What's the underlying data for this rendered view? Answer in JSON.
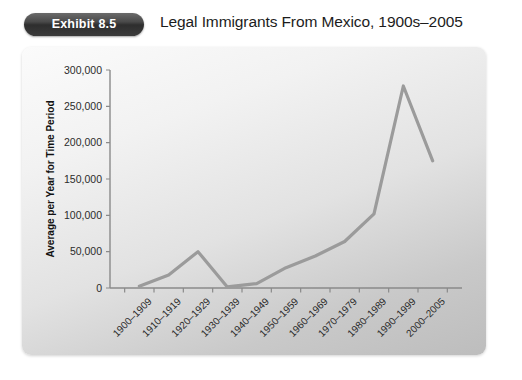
{
  "header": {
    "badge_label": "Exhibit 8.5",
    "title": "Legal Immigrants From Mexico, 1900s–2005"
  },
  "colors": {
    "badge_background": "#3b3b3b",
    "badge_text": "#ffffff",
    "line": "#9b9b9b",
    "axis": "#8a8a8a",
    "panel_light": "#fbfbfb",
    "panel_dark": "#bdbdbd",
    "text": "#1c1c1c"
  },
  "chart_data": {
    "type": "line",
    "title": "Legal Immigrants From Mexico, 1900s–2005",
    "xlabel": "",
    "ylabel": "Average per Year for Time Period",
    "categories": [
      "1900–1909",
      "1910–1919",
      "1920–1929",
      "1930–1939",
      "1940–1949",
      "1950–1959",
      "1960–1969",
      "1970–1979",
      "1980–1989",
      "1990–1999",
      "2000–2005"
    ],
    "values": [
      2500,
      18000,
      50000,
      1500,
      6000,
      28000,
      44000,
      64000,
      102000,
      278000,
      175000
    ],
    "ylim": [
      0,
      300000
    ],
    "ytick_values": [
      0,
      50000,
      100000,
      150000,
      200000,
      250000,
      300000
    ],
    "ytick_labels": [
      "0",
      "50,000",
      "100,000",
      "150,000",
      "200,000",
      "250,000",
      "300,000"
    ],
    "grid": false,
    "legend": false,
    "legend_position": "none",
    "series": [
      {
        "name": "Average per Year for Time Period",
        "color": "#9b9b9b",
        "values": [
          2500,
          18000,
          50000,
          1500,
          6000,
          28000,
          44000,
          64000,
          102000,
          278000,
          175000
        ]
      }
    ]
  }
}
